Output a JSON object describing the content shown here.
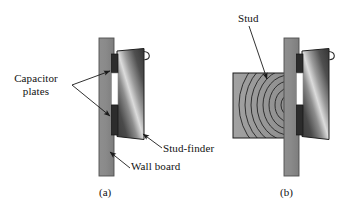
{
  "figure": {
    "labels": {
      "capacitor_plates": "Capacitor\nplates",
      "stud_finder": "Stud-finder",
      "wall_board": "Wall board",
      "stud": "Stud"
    },
    "captions": {
      "panel_a": "(a)",
      "panel_b": "(b)"
    },
    "colors": {
      "background": "#ffffff",
      "wall_board_gray": "#8a8a8a",
      "wall_board_edge": "#5e5e5e",
      "stud_gray": "#9a9a9a",
      "stud_grain_line": "#1d1d1d",
      "device_dark": "#333333",
      "device_mid": "#6f6f6f",
      "device_highlight": "#dcdcdc",
      "plate_dark": "#2a2a2a",
      "gap_white": "#ffffff",
      "leader_line": "#1a1a1a",
      "text": "#111111"
    },
    "panels": [
      {
        "id": "a",
        "caption": "(a)",
        "parts": [
          {
            "name": "wall-board",
            "label": "Wall board"
          },
          {
            "name": "stud-finder",
            "label": "Stud-finder"
          },
          {
            "name": "capacitor-plate-upper",
            "label": "Capacitor plates"
          },
          {
            "name": "capacitor-plate-lower",
            "label": "Capacitor plates"
          },
          {
            "name": "hanger-loop",
            "label": ""
          }
        ]
      },
      {
        "id": "b",
        "caption": "(b)",
        "parts": [
          {
            "name": "stud",
            "label": "Stud"
          },
          {
            "name": "wall-board",
            "label": "Wall board"
          },
          {
            "name": "stud-finder",
            "label": "Stud-finder"
          },
          {
            "name": "capacitor-plate-upper",
            "label": "Capacitor plates"
          },
          {
            "name": "capacitor-plate-lower",
            "label": "Capacitor plates"
          },
          {
            "name": "hanger-loop",
            "label": ""
          }
        ]
      }
    ]
  }
}
